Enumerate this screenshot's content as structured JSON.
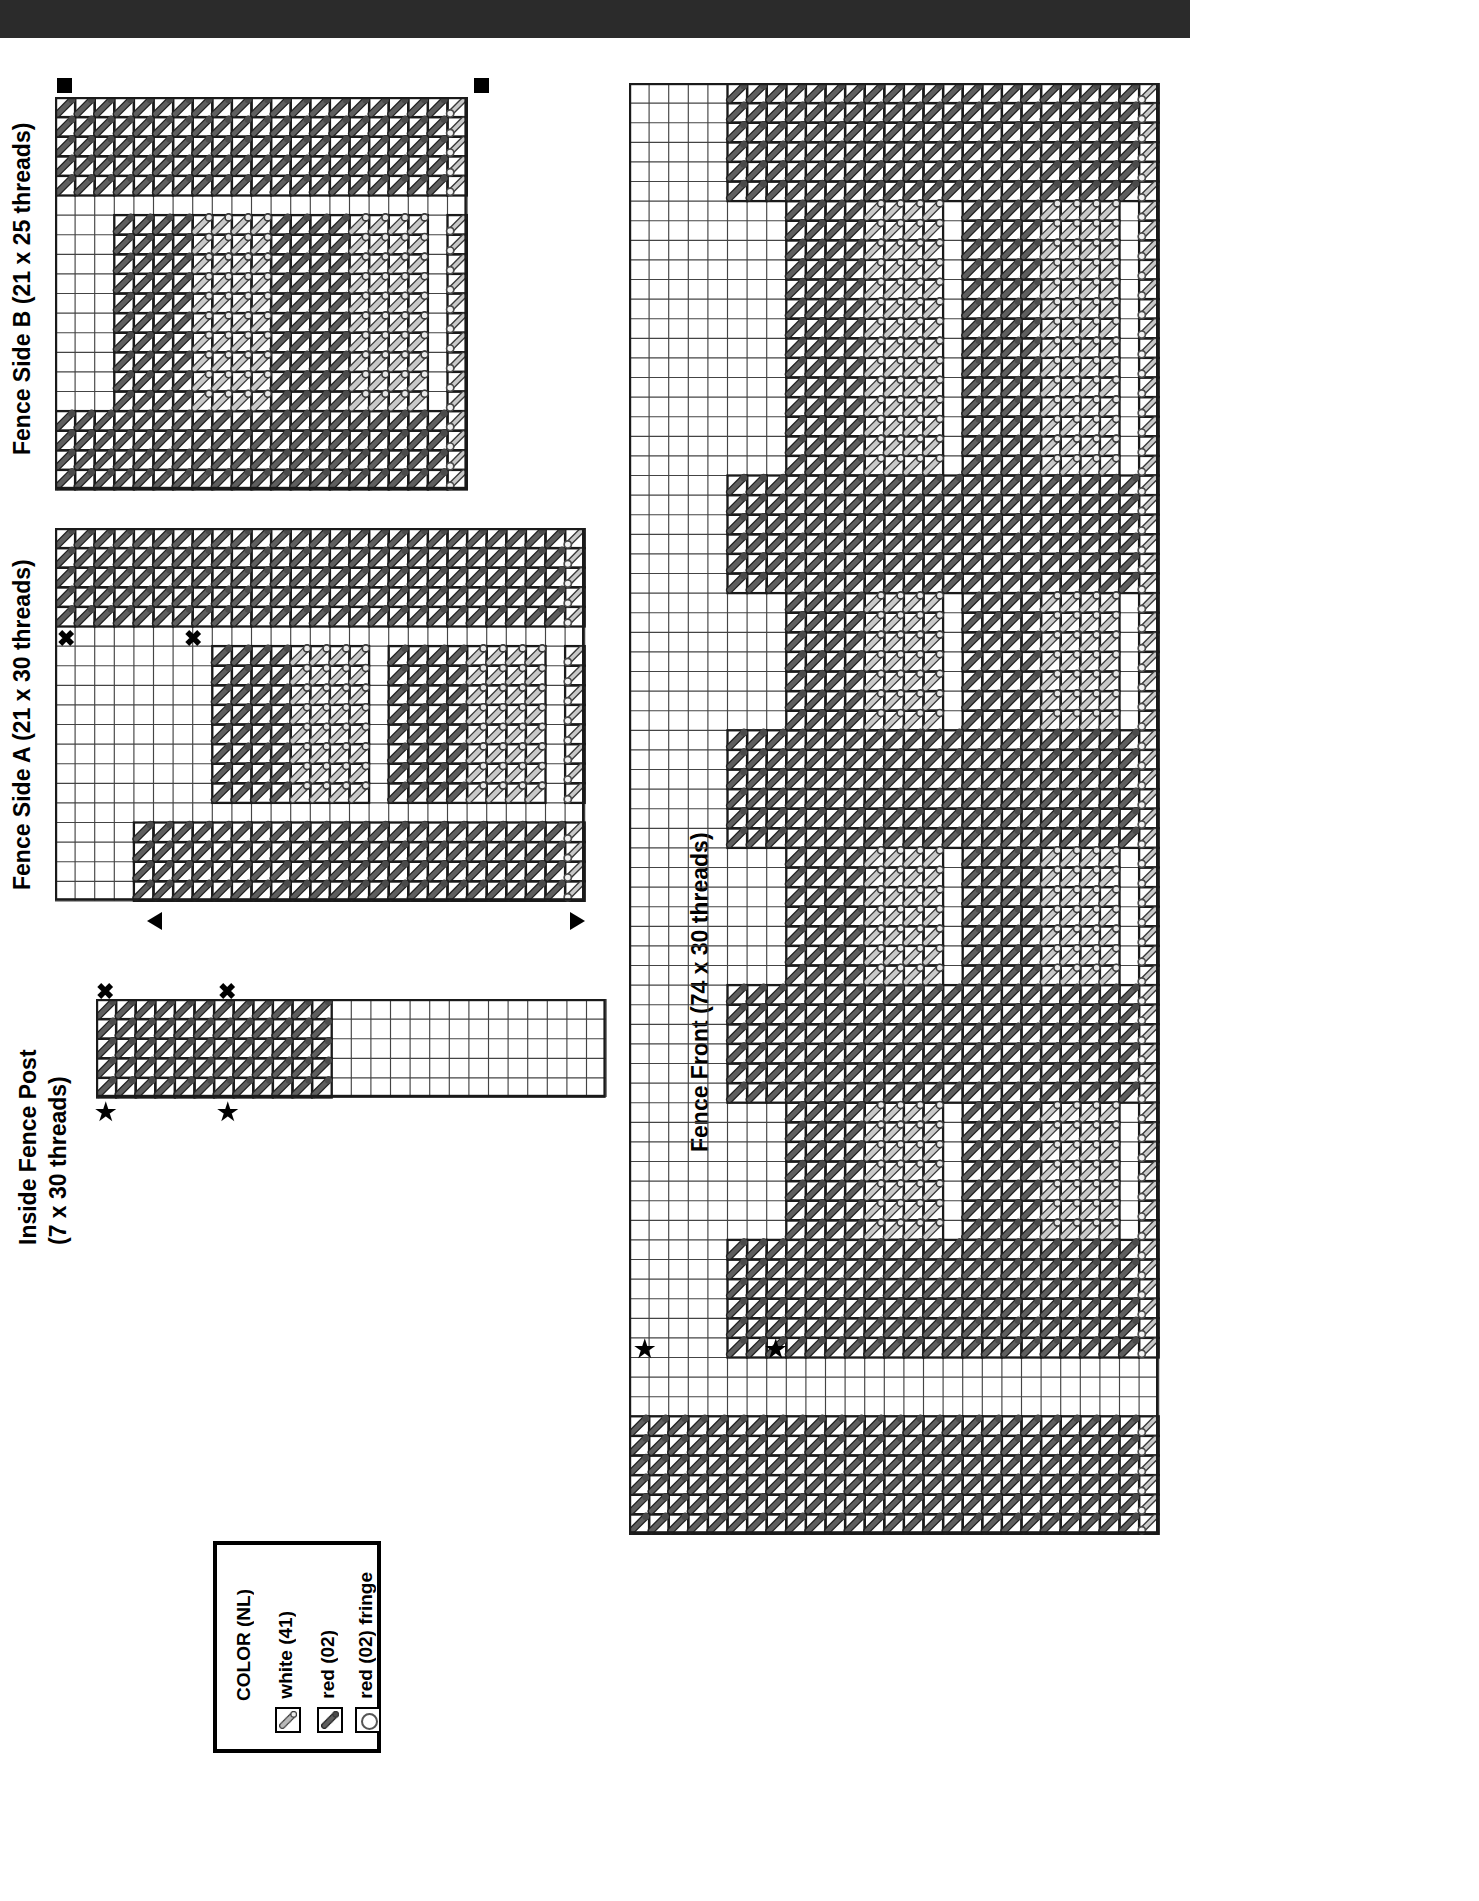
{
  "document": {
    "kind": "plastic-canvas-stitch-chart",
    "background": "#ffffff",
    "top_bar_color": "#2b2b2b"
  },
  "titles": {
    "fence_side_b": "Fence Side B (21 x 25 threads)",
    "fence_side_a": "Fence Side A (21 x 30 threads)",
    "inside_fence_post_line1": "Inside Fence Post",
    "inside_fence_post_line2": "(7 x 30 threads)",
    "fence_front": "Fence Front (74 x 30 threads)"
  },
  "legend": {
    "header": "COLOR (NL)",
    "entries": [
      {
        "label": "white (41)",
        "symbol": "diagonal-light",
        "color": "#b9b9b9"
      },
      {
        "label": "red (02)",
        "symbol": "diagonal-dark",
        "color": "#5e5e5e"
      },
      {
        "label": "red (02) fringe",
        "symbol": "circle-open",
        "color": "#555555"
      }
    ]
  },
  "colors": {
    "grid_line": "#1a1a1a",
    "grid_line_light": "#444444",
    "stitch_dark": "#5e5e5e",
    "stitch_dark_edge": "#222222",
    "stitch_light": "#c9c9c9",
    "stitch_light_edge": "#3a3a3a",
    "knot_dark": "#4a4a4a",
    "knot_light_fill": "#e8e8e8"
  },
  "chart_data": {
    "type": "table",
    "cell_px": 19.6,
    "charts": [
      {
        "name": "fence-side-b",
        "title": "Fence Side B (21 x 25 threads)",
        "origin": [
          55,
          97
        ],
        "cols": 21,
        "rows": 20,
        "markers": [
          {
            "type": "square",
            "x": 0.0,
            "y": -0.85
          },
          {
            "type": "square",
            "x": 21.3,
            "y": -0.85
          }
        ],
        "fringe_col": 20,
        "fringe_rows": [
          0,
          19
        ],
        "regions": [
          {
            "kind": "dark",
            "c0": 0,
            "c1": 20,
            "r0": 0,
            "r1": 4
          },
          {
            "kind": "dark",
            "c0": 0,
            "c1": 20,
            "r0": 16,
            "r1": 20
          },
          {
            "kind": "dark",
            "c0": 3,
            "c1": 6,
            "r0": 6,
            "r1": 15
          },
          {
            "kind": "light",
            "c0": 7,
            "c1": 10,
            "r0": 6,
            "r1": 15
          },
          {
            "kind": "dark",
            "c0": 11,
            "c1": 14,
            "r0": 6,
            "r1": 15
          },
          {
            "kind": "light",
            "c0": 15,
            "c1": 18,
            "r0": 6,
            "r1": 15
          }
        ],
        "blank_cells_left": true
      },
      {
        "name": "fence-side-a",
        "title": "Fence Side A (21 x 30 threads)",
        "origin": [
          55,
          528
        ],
        "cols": 27,
        "rows": 19,
        "markers": [
          {
            "type": "x",
            "x": 0.1,
            "y": 5.1
          },
          {
            "type": "x",
            "x": 6.6,
            "y": 5.1
          },
          {
            "type": "triangle-l",
            "x": 4.7,
            "y": 19.6
          },
          {
            "type": "triangle-r",
            "x": 26.3,
            "y": 19.6
          }
        ],
        "fringe_col": 26,
        "regions": [
          {
            "kind": "dark",
            "c0": 0,
            "c1": 25,
            "r0": 0,
            "r1": 4
          },
          {
            "kind": "dark",
            "c0": 4,
            "c1": 25,
            "r0": 15,
            "r1": 19
          },
          {
            "kind": "dark",
            "c0": 8,
            "c1": 11,
            "r0": 6,
            "r1": 13
          },
          {
            "kind": "light",
            "c0": 12,
            "c1": 15,
            "r0": 6,
            "r1": 13
          },
          {
            "kind": "dark",
            "c0": 17,
            "c1": 20,
            "r0": 6,
            "r1": 13
          },
          {
            "kind": "light",
            "c0": 21,
            "c1": 24,
            "r0": 6,
            "r1": 13
          }
        ]
      },
      {
        "name": "inside-fence-post",
        "title": "Inside Fence Post (7 x 30 threads)",
        "origin": [
          96,
          999
        ],
        "cols": 26,
        "rows": 5,
        "markers": [
          {
            "type": "x",
            "x": 0.0,
            "y": -0.9
          },
          {
            "type": "x",
            "x": 6.2,
            "y": -0.9
          },
          {
            "type": "star",
            "x": 0.0,
            "y": 5.15
          },
          {
            "type": "star",
            "x": 6.2,
            "y": 5.15
          }
        ],
        "regions": [
          {
            "kind": "dark",
            "c0": 0,
            "c1": 11,
            "r0": 0,
            "r1": 5
          }
        ]
      },
      {
        "name": "fence-front",
        "title": "Fence Front (74 x 30 threads)",
        "origin": [
          629,
          83
        ],
        "cols": 27,
        "rows": 74,
        "markers": [
          {
            "type": "star",
            "x": 0.3,
            "y": 64.0
          },
          {
            "type": "star",
            "x": 7.0,
            "y": 64.0
          }
        ],
        "fringe_col": 26,
        "rails": [
          {
            "c0": 5,
            "c1": 25,
            "r0": 0,
            "r1": 5
          },
          {
            "c0": 5,
            "c1": 25,
            "r0": 20,
            "r1": 25
          },
          {
            "c0": 5,
            "c1": 25,
            "r0": 33,
            "r1": 38
          },
          {
            "c0": 5,
            "c1": 25,
            "r0": 46,
            "r1": 51
          },
          {
            "c0": 5,
            "c1": 25,
            "r0": 59,
            "r1": 64
          },
          {
            "c0": 0,
            "c1": 25,
            "r0": 68,
            "r1": 73
          }
        ],
        "pickets": [
          {
            "r0": 6,
            "r1": 19
          },
          {
            "r0": 26,
            "r1": 32
          },
          {
            "r0": 39,
            "r1": 45
          },
          {
            "r0": 52,
            "r1": 58
          }
        ],
        "picket_bands": [
          {
            "kind": "dark",
            "c0": 8,
            "c1": 11
          },
          {
            "kind": "light",
            "c0": 12,
            "c1": 15
          },
          {
            "kind": "dark",
            "c0": 17,
            "c1": 20
          },
          {
            "kind": "light",
            "c0": 21,
            "c1": 24
          }
        ]
      }
    ]
  }
}
